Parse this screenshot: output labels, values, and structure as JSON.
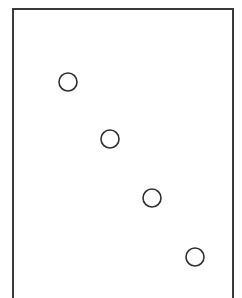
{
  "diagram": {
    "frame": {
      "stroke_color": "#3a3a3a"
    },
    "circles": [
      {
        "cx": 68,
        "cy": 82,
        "r": 9
      },
      {
        "cx": 110,
        "cy": 139,
        "r": 9
      },
      {
        "cx": 152,
        "cy": 198,
        "r": 9
      },
      {
        "cx": 195,
        "cy": 257,
        "r": 9
      }
    ],
    "circle_stroke_color": "#2e2e2e",
    "circle_fill_color": "#ffffff"
  }
}
